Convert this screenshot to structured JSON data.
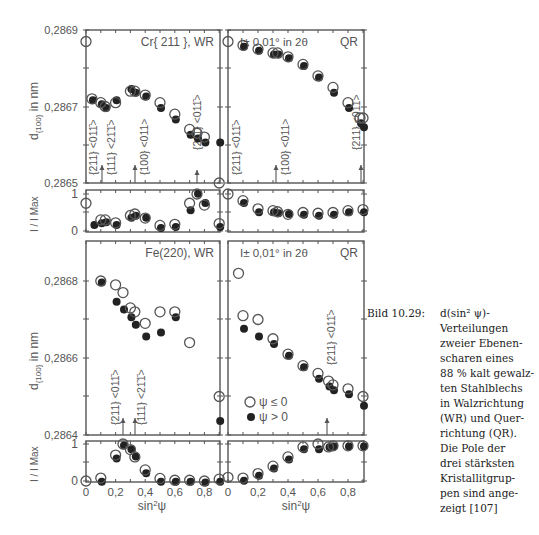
{
  "caption": {
    "label": "Bild 10.29:",
    "lines": [
      "d(sin² ψ)-",
      "Verteilungen",
      "zweier Ebenen-",
      "scharen eines",
      "88 % kalt gewalz-",
      "ten Stahlblechs",
      "in Walzrichtung",
      "(WR) und Quer-",
      "richtung (QR).",
      "Die Pole der",
      "drei stärksten",
      "Kristallitgrup-",
      "pen sind ange-",
      "zeigt [107]"
    ]
  },
  "legend": {
    "open": "ψ ≤ 0",
    "filled": "ψ > 0"
  },
  "chart_data": [
    {
      "type": "scatter",
      "panel": "top-left-d",
      "title": "Cr{ 211 }, WR",
      "xlabel": "sin²ψ",
      "ylabel": "d{100} in nm",
      "ylim": [
        0.2865,
        0.2869
      ],
      "yticks": [
        "0,2865",
        "0,2867",
        "0,2869"
      ],
      "xlim": [
        0,
        0.9
      ],
      "annotations": [
        {
          "text": "{211} <011̄>",
          "x": 0.1
        },
        {
          "text": "{111} <21̄1̄>",
          "x": 0.2
        },
        {
          "text": "{100} <011>",
          "x": 0.33
        },
        {
          "text": "{211} <011̄>",
          "x": 0.67
        }
      ],
      "series": [
        {
          "name": "ψ ≤ 0",
          "x": [
            0,
            0.04,
            0.1,
            0.13,
            0.2,
            0.3,
            0.33,
            0.4,
            0.5,
            0.6,
            0.7,
            0.75,
            0.8,
            0.9
          ],
          "y": [
            0.28687,
            0.28672,
            0.28671,
            0.2867,
            0.28671,
            0.28674,
            0.28674,
            0.28673,
            0.28671,
            0.28668,
            0.28664,
            0.28663,
            0.28662,
            0.2865
          ]
        },
        {
          "name": "ψ > 0",
          "x": [
            0.04,
            0.1,
            0.13,
            0.2,
            0.3,
            0.33,
            0.4,
            0.5,
            0.6,
            0.7,
            0.75,
            0.8,
            0.9
          ],
          "y": [
            0.28672,
            0.28671,
            0.2867,
            0.28672,
            0.28675,
            0.28674,
            0.28673,
            0.2867,
            0.28667,
            0.28663,
            0.28662,
            0.28661,
            0.28661
          ]
        }
      ]
    },
    {
      "type": "scatter",
      "panel": "top-right-d",
      "title": "QR",
      "note": "I± 0,01° in 2θ",
      "xlim": [
        0,
        0.9
      ],
      "ylim": [
        0.2865,
        0.2869
      ],
      "annotations": [
        {
          "text": "{211} <011̄>",
          "x": 0.0
        },
        {
          "text": "{100} <011>",
          "x": 0.33
        },
        {
          "text": "{211} <011̄>",
          "x": 0.88
        }
      ],
      "series": [
        {
          "name": "ψ ≤ 0",
          "x": [
            0,
            0.1,
            0.2,
            0.3,
            0.33,
            0.4,
            0.5,
            0.6,
            0.7,
            0.8,
            0.88,
            0.9
          ],
          "y": [
            0.28687,
            0.28686,
            0.28685,
            0.28684,
            0.28684,
            0.28683,
            0.28681,
            0.28678,
            0.28675,
            0.28671,
            0.28667,
            0.28667
          ]
        },
        {
          "name": "ψ > 0",
          "x": [
            0.1,
            0.2,
            0.3,
            0.33,
            0.4,
            0.5,
            0.6,
            0.7,
            0.8,
            0.88,
            0.9
          ],
          "y": [
            0.28686,
            0.28685,
            0.28684,
            0.28684,
            0.28683,
            0.28681,
            0.28678,
            0.28674,
            0.2867,
            0.28666,
            0.28665
          ]
        }
      ]
    },
    {
      "type": "scatter",
      "panel": "top-left-intensity",
      "ylabel": "I / I Max",
      "ylim": [
        0,
        1
      ],
      "yticks": [
        "0",
        "1"
      ],
      "series": [
        {
          "name": "ψ ≤ 0",
          "x": [
            0,
            0.1,
            0.13,
            0.2,
            0.3,
            0.33,
            0.4,
            0.5,
            0.6,
            0.7,
            0.75,
            0.8,
            0.9
          ],
          "y": [
            0.75,
            0.3,
            0.3,
            0.22,
            0.42,
            0.46,
            0.35,
            0.15,
            0.18,
            0.75,
            1.0,
            0.7,
            0.2
          ]
        },
        {
          "name": "ψ > 0",
          "x": [
            0.05,
            0.1,
            0.13,
            0.2,
            0.3,
            0.33,
            0.4,
            0.5,
            0.6,
            0.7,
            0.75,
            0.8,
            0.9
          ],
          "y": [
            0.2,
            0.25,
            0.28,
            0.2,
            0.4,
            0.45,
            0.4,
            0.12,
            0.15,
            0.6,
            1.05,
            0.8,
            0.15
          ]
        }
      ]
    },
    {
      "type": "scatter",
      "panel": "top-right-intensity",
      "series": [
        {
          "name": "ψ ≤ 0",
          "x": [
            0,
            0.1,
            0.2,
            0.3,
            0.33,
            0.4,
            0.5,
            0.6,
            0.7,
            0.8,
            0.9
          ],
          "y": [
            1.0,
            0.82,
            0.6,
            0.55,
            0.52,
            0.45,
            0.5,
            0.48,
            0.5,
            0.55,
            0.58
          ]
        },
        {
          "name": "ψ > 0",
          "x": [
            0.1,
            0.2,
            0.3,
            0.33,
            0.4,
            0.5,
            0.6,
            0.7,
            0.8,
            0.9
          ],
          "y": [
            0.8,
            0.55,
            0.55,
            0.52,
            0.5,
            0.48,
            0.45,
            0.48,
            0.55,
            0.55
          ]
        }
      ]
    },
    {
      "type": "scatter",
      "panel": "bottom-left-d",
      "title": "Fe(220), WR",
      "xlabel": "sin²ψ",
      "ylabel": "d{100} in nm",
      "ylim": [
        0.2864,
        0.2869
      ],
      "yticks": [
        "0,2864",
        "0,2866",
        "0,2868"
      ],
      "xticks": [
        "0",
        "0,2",
        "0,4",
        "0,6",
        "0,8"
      ],
      "annotations": [
        {
          "text": "{211} <011̄>",
          "x": 0.25
        },
        {
          "text": "{111} <21̄1̄>",
          "x": 0.33
        }
      ],
      "series": [
        {
          "name": "ψ ≤ 0",
          "x": [
            0.1,
            0.2,
            0.25,
            0.3,
            0.33,
            0.4,
            0.5,
            0.6,
            0.7,
            0.9
          ],
          "y": [
            0.2868,
            0.28679,
            0.28677,
            0.28673,
            0.28672,
            0.28669,
            0.28672,
            0.28672,
            0.28664,
            0.2865
          ]
        },
        {
          "name": "ψ > 0",
          "x": [
            0.1,
            0.2,
            0.25,
            0.3,
            0.33,
            0.4,
            0.5,
            0.6,
            0.9
          ],
          "y": [
            0.2868,
            0.28675,
            0.28673,
            0.28671,
            0.28669,
            0.28666,
            0.28667,
            0.28671,
            0.28644
          ]
        }
      ]
    },
    {
      "type": "scatter",
      "panel": "bottom-right-d",
      "title": "QR",
      "note": "I± 0,01° in 2θ",
      "xticks": [
        "0",
        "0,2",
        "0,4",
        "0,6",
        "0,8"
      ],
      "xlabel": "sin²ψ",
      "annotations": [
        {
          "text": "{211} <011̄>",
          "x": 0.67
        }
      ],
      "series": [
        {
          "name": "ψ ≤ 0",
          "x": [
            0.07,
            0.1,
            0.2,
            0.3,
            0.4,
            0.5,
            0.6,
            0.67,
            0.7,
            0.8,
            0.9
          ],
          "y": [
            0.28682,
            0.28671,
            0.2867,
            0.28665,
            0.28661,
            0.28658,
            0.28656,
            0.28654,
            0.28653,
            0.28652,
            0.2865
          ]
        },
        {
          "name": "ψ > 0",
          "x": [
            0.1,
            0.2,
            0.3,
            0.4,
            0.5,
            0.6,
            0.67,
            0.7,
            0.8,
            0.9
          ],
          "y": [
            0.28668,
            0.28666,
            0.28664,
            0.28661,
            0.28658,
            0.28655,
            0.28653,
            0.28652,
            0.28651,
            0.28648
          ]
        }
      ]
    },
    {
      "type": "scatter",
      "panel": "bottom-left-intensity",
      "ylabel": "I / I Max",
      "series": [
        {
          "name": "ψ ≤ 0",
          "x": [
            0,
            0.1,
            0.2,
            0.25,
            0.3,
            0.33,
            0.4,
            0.5,
            0.6,
            0.7,
            0.8,
            0.9
          ],
          "y": [
            0,
            0.08,
            0.7,
            1.0,
            0.85,
            0.65,
            0.3,
            0.07,
            0.02,
            0.02,
            0.0,
            0.05
          ]
        },
        {
          "name": "ψ > 0",
          "x": [
            0.1,
            0.2,
            0.25,
            0.3,
            0.33,
            0.4,
            0.5,
            0.6,
            0.7,
            0.8,
            0.9
          ],
          "y": [
            0.02,
            0.65,
            1.0,
            0.9,
            0.7,
            0.25,
            0.02,
            0.02,
            0.02,
            0.0,
            0.02
          ]
        }
      ]
    },
    {
      "type": "scatter",
      "panel": "bottom-right-intensity",
      "series": [
        {
          "name": "ψ ≤ 0",
          "x": [
            0,
            0.1,
            0.2,
            0.3,
            0.4,
            0.5,
            0.6,
            0.67,
            0.7,
            0.8,
            0.9
          ],
          "y": [
            0.1,
            0.08,
            0.2,
            0.4,
            0.65,
            0.92,
            1.0,
            0.92,
            0.95,
            0.95,
            0.95
          ]
        },
        {
          "name": "ψ > 0",
          "x": [
            0.1,
            0.2,
            0.3,
            0.4,
            0.5,
            0.6,
            0.67,
            0.7,
            0.8,
            0.9
          ],
          "y": [
            0.05,
            0.18,
            0.38,
            0.62,
            0.9,
            0.9,
            0.95,
            0.97,
            0.97,
            0.97
          ]
        }
      ]
    }
  ]
}
